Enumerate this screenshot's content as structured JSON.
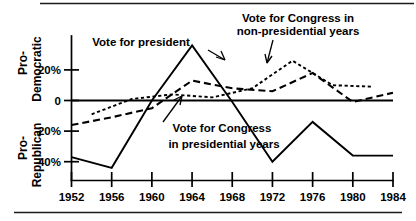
{
  "chart_data": {
    "type": "line",
    "title": "",
    "subtitle": "",
    "xlabel": "",
    "ylabel": "",
    "axis_top_label": "Pro-\nDemocratic",
    "axis_bottom_label": "Pro-\nRepublican",
    "grid": false,
    "legend_position": "inline-annotations",
    "x": [
      1952,
      1954,
      1956,
      1958,
      1960,
      1962,
      1964,
      1966,
      1968,
      1970,
      1972,
      1974,
      1976,
      1978,
      1980,
      1982,
      1984
    ],
    "xlim": [
      1952,
      1984
    ],
    "ylim": [
      -48,
      40
    ],
    "y_tick_values": [
      20,
      0,
      -20,
      -40
    ],
    "y_tick_labels": [
      "20%",
      "0",
      "20%",
      "40%"
    ],
    "x_tick_values": [
      1952,
      1956,
      1960,
      1964,
      1968,
      1972,
      1976,
      1980,
      1984
    ],
    "x_tick_labels": [
      "1952",
      "1956",
      "1960",
      "1964",
      "1968",
      "1972",
      "1976",
      "1980",
      "1984"
    ],
    "series": [
      {
        "name": "Vote for president",
        "style": "solid",
        "x": [
          1952,
          1956,
          1960,
          1964,
          1968,
          1972,
          1976,
          1980,
          1984
        ],
        "values": [
          -37,
          -44,
          0,
          36,
          -1,
          -40,
          -14,
          -36,
          -36
        ]
      },
      {
        "name": "Vote for Congress in presidential years",
        "style": "long-dash",
        "x": [
          1952,
          1956,
          1960,
          1964,
          1968,
          1972,
          1976,
          1980,
          1984
        ],
        "values": [
          -16,
          -11,
          -5,
          13,
          8,
          6,
          18,
          -1,
          5
        ]
      },
      {
        "name": "Vote for Congress in non-presidential years",
        "style": "short-dash",
        "x": [
          1954,
          1958,
          1962,
          1966,
          1970,
          1974,
          1978,
          1982
        ],
        "values": [
          -9,
          1,
          4,
          2,
          8,
          26,
          10,
          9
        ]
      }
    ],
    "annotations": [
      {
        "name": "vote-for-president",
        "text": "Vote for president",
        "lines": [
          "Vote for president"
        ],
        "x": 141,
        "y": 46
      },
      {
        "name": "vote-for-congress-nonpresidential",
        "text": "Vote for Congress in non-presidential years",
        "lines": [
          "Vote for Congress in",
          "non-presidential years"
        ],
        "x": 298,
        "y": 22
      },
      {
        "name": "vote-for-congress-presidential",
        "text": "Vote for Congress in presidential years",
        "lines": [
          "Vote for Congress",
          "in presidential years"
        ],
        "x": 222,
        "y": 132
      }
    ],
    "axis_labels": {
      "democratic_line1": "Pro-",
      "democratic_line2": "Democratic",
      "republican_line1": "Pro-",
      "republican_line2": "Republican"
    }
  }
}
